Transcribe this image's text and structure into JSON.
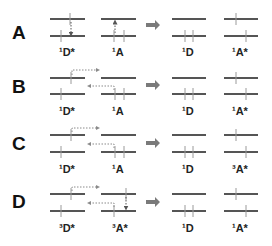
{
  "figure": {
    "rows": [
      {
        "id": "A",
        "letter": "A",
        "before": {
          "donor_label": "¹D*",
          "acceptor_label": "¹A"
        },
        "after": {
          "donor_label": "¹D",
          "acceptor_label": "¹A*"
        },
        "mechanism": "direct vertical transfer"
      },
      {
        "id": "B",
        "letter": "B",
        "before": {
          "donor_label": "¹D*",
          "acceptor_label": "¹A"
        },
        "after": {
          "donor_label": "¹D",
          "acceptor_label": "¹A*"
        },
        "mechanism": "electron exchange (dotted arrows)"
      },
      {
        "id": "C",
        "letter": "C",
        "before": {
          "donor_label": "¹D*",
          "acceptor_label": "¹A"
        },
        "after": {
          "donor_label": "¹D",
          "acceptor_label": "³A*"
        },
        "mechanism": "electron exchange (dotted arrows)"
      },
      {
        "id": "D",
        "letter": "D",
        "before": {
          "donor_label": "³D*",
          "acceptor_label": "³A*"
        },
        "after": {
          "donor_label": "¹D",
          "acceptor_label": "¹A*"
        },
        "mechanism": "electron exchange with acceptor relaxation"
      }
    ],
    "process_arrow": "right-arrow-icon",
    "colors": {
      "level_line": "#555555",
      "spin_arrow": "#9a9a9a",
      "transfer_arrow": "#8a8a8a",
      "process_arrow": "#7a7a7a",
      "text": "#111111"
    }
  }
}
